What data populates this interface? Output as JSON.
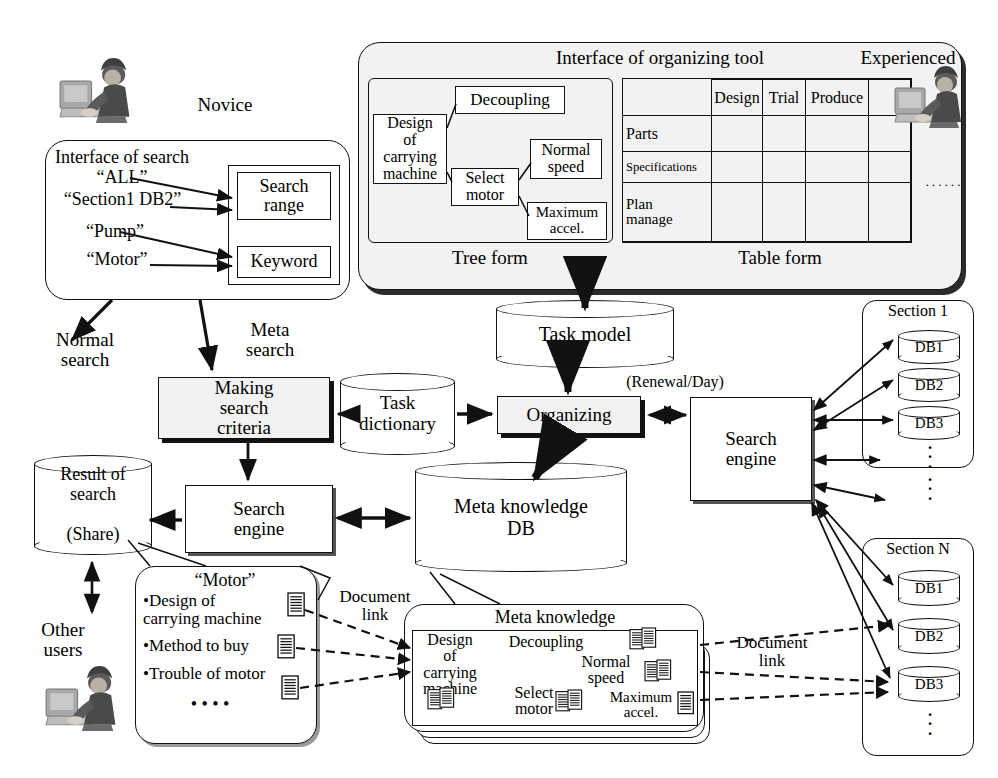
{
  "actors": {
    "novice": "Novice",
    "experienced": "Experienced",
    "other_users": "Other\nusers"
  },
  "search_interface": {
    "title": "Interface of search",
    "queries": [
      "“ALL”",
      "“Section1 DB2”",
      "“Pump”",
      "“Motor”"
    ],
    "fields": [
      "Search\nrange",
      "Keyword"
    ]
  },
  "organizing_tool": {
    "title": "Interface of organizing tool",
    "tree_caption": "Tree form",
    "table_caption": "Table form",
    "tree_nodes": {
      "root": "Design\nof\ncarrying\nmachine",
      "decoupling": "Decoupling",
      "select_motor": "Select\nmotor",
      "normal_speed": "Normal\nspeed",
      "maximum_accel": "Maximum\naccel."
    },
    "table": {
      "columns": [
        "",
        "Design",
        "Trial",
        "Produce",
        ""
      ],
      "rows": [
        {
          "header": "Parts",
          "cells": [
            "",
            "",
            "",
            ""
          ]
        },
        {
          "header": "Specifications",
          "cells": [
            "",
            "",
            "",
            ""
          ]
        },
        {
          "header": "Plan\nmanage",
          "cells": [
            "",
            "",
            "",
            ""
          ]
        }
      ],
      "ellipsis": "······"
    }
  },
  "flow": {
    "normal_search": "Normal\nsearch",
    "meta_search": "Meta\nsearch",
    "making_search_criteria": "Making\nsearch\ncriteria",
    "task_dictionary": "Task\ndictionary",
    "task_model": "Task model",
    "organizing": "Organizing",
    "renewal": "(Renewal/Day)",
    "search_engine_right": "Search\nengine",
    "search_engine_left": "Search\nengine",
    "result_of_search": "Result of\nsearch\n\n(Share)",
    "meta_knowledge_db": "Meta knowledge\nDB",
    "document_link_left": "Document\nlink",
    "document_link_right": "Document\nlink"
  },
  "result_panel": {
    "title": "“Motor”",
    "items": [
      "•Design of\n carrying machine",
      "•Method to buy",
      "•Trouble of motor"
    ],
    "ellipsis": "•  •  •  •"
  },
  "meta_knowledge_panel": {
    "title": "Meta knowledge",
    "nodes": {
      "root": "Design\nof\ncarrying\nmachine",
      "decoupling": "Decoupling",
      "select_motor": "Select\nmotor",
      "normal_speed": "Normal\nspeed",
      "maximum_accel": "Maximum\naccel."
    }
  },
  "sections": [
    {
      "title": "Section 1",
      "dbs": [
        "DB1",
        "DB2",
        "DB3"
      ],
      "more": "·\n·\n·"
    },
    {
      "title": "Section N",
      "dbs": [
        "DB1",
        "DB2",
        "DB3"
      ],
      "more": "·\n·\n·"
    }
  ],
  "inter_section_dots": "·\n·\n·",
  "colors": {
    "ink": "#111111",
    "panel": "#f2f2f2",
    "shadow": "#2b2b2b"
  }
}
